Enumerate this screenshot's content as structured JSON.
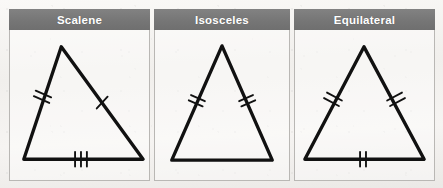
{
  "page": {
    "cropped_title_fragment": "Types",
    "background_color": "#f3f2f0",
    "header_fill": "#7a7a7a",
    "header_text_color": "#ffffff",
    "stroke_color": "#111111",
    "panel_border_color": "#b9b7b4"
  },
  "table": {
    "columns": [
      {
        "id": "scalene",
        "header": "Scalene",
        "figure": {
          "name": "scalene-triangle",
          "vertices": {
            "apex": [
              52,
              16
            ],
            "bottom_left": [
              14,
              130
            ],
            "bottom_right": [
              135,
              130
            ]
          },
          "tick_marks": {
            "left_side": 2,
            "right_side": 1,
            "base": 3
          },
          "description": "Scalene triangle: all three sides different lengths, shown by 2, 1 and 3 congruence ticks"
        }
      },
      {
        "id": "isosceles",
        "header": "Isosceles",
        "figure": {
          "name": "isosceles-triangle",
          "vertices": {
            "apex": [
              68,
              15
            ],
            "bottom_left": [
              17,
              131
            ],
            "bottom_right": [
              119,
              131
            ]
          },
          "tick_marks": {
            "left_side": 2,
            "right_side": 2,
            "base": 0
          },
          "description": "Isosceles triangle: two equal sides marked with matching double ticks, base unmarked"
        }
      },
      {
        "id": "equilateral",
        "header": "Equilateral",
        "figure": {
          "name": "equilateral-triangle",
          "vertices": {
            "apex": [
              70,
              16
            ],
            "bottom_left": [
              10,
              130
            ],
            "bottom_right": [
              131,
              130
            ]
          },
          "tick_marks": {
            "left_side": 2,
            "right_side": 2,
            "base": 2
          },
          "description": "Equilateral triangle: all three sides marked with matching double ticks"
        }
      }
    ]
  }
}
